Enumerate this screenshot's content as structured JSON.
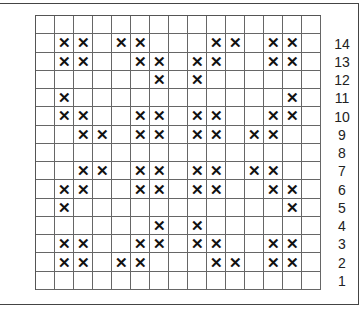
{
  "chart_data": {
    "type": "grid-pattern",
    "columns": 15,
    "rows": 15,
    "mark_symbol": "✕",
    "row_labels": [
      "",
      "14",
      "13",
      "12",
      "11",
      "10",
      "9",
      "8",
      "7",
      "6",
      "5",
      "4",
      "3",
      "2",
      "1"
    ],
    "marked_columns_by_row": [
      [],
      [
        1,
        2,
        4,
        5,
        9,
        10,
        12,
        13
      ],
      [
        1,
        2,
        5,
        6,
        8,
        9,
        12,
        13
      ],
      [
        6,
        8
      ],
      [
        1,
        13
      ],
      [
        1,
        2,
        5,
        6,
        8,
        9,
        12,
        13
      ],
      [
        2,
        3,
        5,
        6,
        8,
        9,
        11,
        12
      ],
      [],
      [
        2,
        3,
        5,
        6,
        8,
        9,
        11,
        12
      ],
      [
        1,
        2,
        5,
        6,
        8,
        9,
        12,
        13
      ],
      [
        1,
        13
      ],
      [
        6,
        8
      ],
      [
        1,
        2,
        5,
        6,
        8,
        9,
        12,
        13
      ],
      [
        1,
        2,
        4,
        5,
        9,
        10,
        12,
        13
      ],
      []
    ]
  }
}
